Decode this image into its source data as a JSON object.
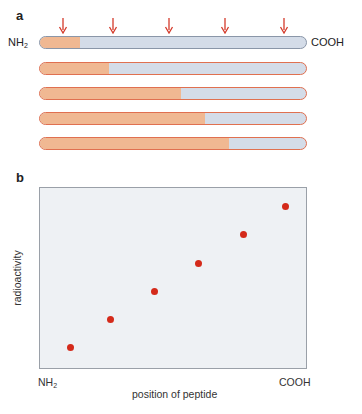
{
  "panel_a": {
    "label": "a",
    "left_terminus": "NH",
    "left_terminus_sub": "2",
    "right_terminus": "COOH",
    "arrow_color": "#d43a2a",
    "arrow_x": [
      63,
      113,
      169,
      225,
      284
    ],
    "bars": [
      {
        "fill_fraction": 0.15,
        "top": 36
      },
      {
        "fill_fraction": 0.26,
        "top": 62
      },
      {
        "fill_fraction": 0.53,
        "top": 87
      },
      {
        "fill_fraction": 0.62,
        "top": 112
      },
      {
        "fill_fraction": 0.71,
        "top": 137
      }
    ],
    "colors": {
      "labeled": "#f0b892",
      "unlabeled": "#d4dce8"
    }
  },
  "panel_b": {
    "label": "b",
    "ylabel": "radioactivity",
    "xlabel": "position of peptide",
    "x_left_tick": "NH",
    "x_left_tick_sub": "2",
    "x_right_tick": "COOH"
  },
  "chart_data": {
    "type": "scatter",
    "title": "",
    "xlabel": "position of peptide",
    "ylabel": "radioactivity",
    "x_tick_labels": [
      "NH2",
      "COOH"
    ],
    "grid": false,
    "legend": null,
    "series": [
      {
        "name": "radioactivity",
        "color": "#d42a1a",
        "x": [
          1,
          2,
          3,
          4,
          5,
          6
        ],
        "y": [
          1,
          2,
          3,
          4,
          5,
          6
        ]
      }
    ],
    "points_px": [
      [
        70,
        347
      ],
      [
        110,
        319
      ],
      [
        154,
        291
      ],
      [
        198,
        263
      ],
      [
        243,
        234
      ],
      [
        285,
        206
      ]
    ]
  }
}
